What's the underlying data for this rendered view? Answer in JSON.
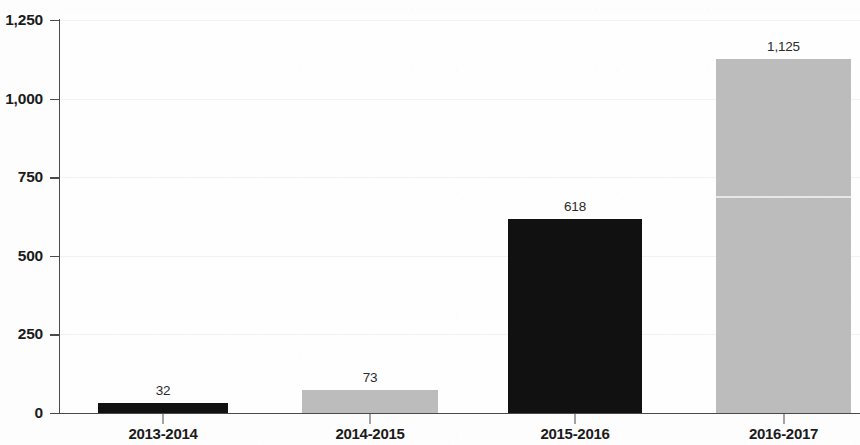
{
  "chart_data": {
    "type": "bar",
    "title": "",
    "subtitle": "",
    "xlabel": "",
    "ylabel": "",
    "categories": [
      "2013-2014",
      "2014-2015",
      "2015-2016",
      "2016-2017"
    ],
    "values": [
      32,
      73,
      618,
      1125
    ],
    "value_labels": [
      "32",
      "73",
      "618",
      "1,125"
    ],
    "bar_colors": [
      "#111111",
      "#bcbcbc",
      "#111111",
      "#bcbcbc"
    ],
    "ylim": [
      0,
      1250
    ],
    "y_ticks": [
      0,
      250,
      500,
      750,
      1000,
      1250
    ],
    "y_tick_labels": [
      "0",
      "250",
      "500",
      "750",
      "1,000",
      "1,250"
    ],
    "grid": true,
    "grid_axis": "y",
    "legend": false,
    "legend_position": "none",
    "background_color": "#fdfdfd",
    "axis_color": "#4a4a4a",
    "text_color": "#1b1b1b"
  }
}
